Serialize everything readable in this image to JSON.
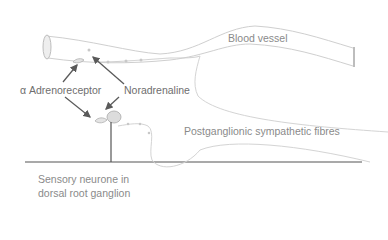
{
  "diagram": {
    "labels": {
      "blood_vessel": "Blood vessel",
      "alpha_adrenoreceptor": "α Adrenoreceptor",
      "noradrenaline": "Noradrenaline",
      "postganglionic_fibres": "Postganglionic sympathetic fibres",
      "sensory_neurone_line1": "Sensory neurone in",
      "sensory_neurone_line2": "dorsal root ganglion"
    },
    "colors": {
      "background": "#ffffff",
      "text": "#8a8a8a",
      "line_light": "#cfcfcf",
      "line_dark": "#555555",
      "arrow": "#5a5a5a"
    }
  }
}
